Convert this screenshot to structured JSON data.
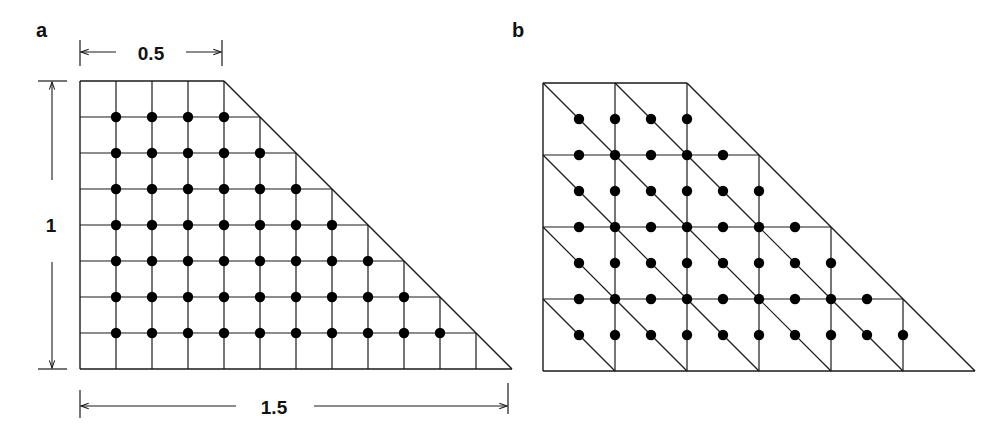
{
  "figure": {
    "panels": [
      {
        "id": "a",
        "label": "a",
        "description": "Trapezoidal domain discretized with a uniform rectangular grid; filled dots mark interior nodes",
        "dimensions": {
          "top_width": "0.5",
          "height": "1",
          "bottom_width": "1.5"
        },
        "grid": {
          "rows": 8,
          "bottom_cols": 12,
          "top_cols": 4
        },
        "node_counts_per_row": [
          4,
          5,
          6,
          7,
          8,
          9,
          10
        ]
      },
      {
        "id": "b",
        "label": "b",
        "description": "Same trapezoidal domain with a coarser grid of squares split into triangles by diagonals; dots mark nodes at vertices and edge midpoints",
        "grid": {
          "rows": 4,
          "bottom_cols": 6,
          "top_cols": 2
        },
        "node_counts_per_row": [
          4,
          5,
          6,
          7,
          8,
          9,
          10
        ]
      }
    ],
    "colors": {
      "line": "#1a1a1a",
      "node": "#000000",
      "background": "#ffffff"
    }
  }
}
